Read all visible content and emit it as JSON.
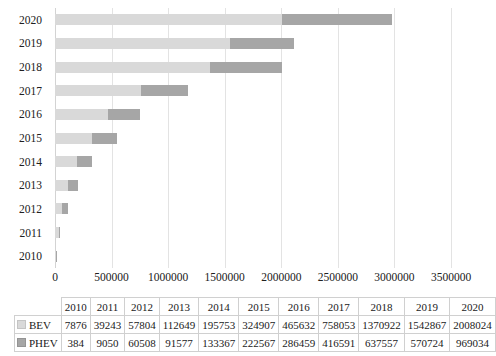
{
  "chart_data": {
    "type": "bar",
    "orientation": "horizontal",
    "stacked": true,
    "title": "",
    "xlabel": "",
    "ylabel": "",
    "categories": [
      "2010",
      "2011",
      "2012",
      "2013",
      "2014",
      "2015",
      "2016",
      "2017",
      "2018",
      "2019",
      "2020"
    ],
    "series": [
      {
        "name": "BEV",
        "color": "#d9d9d9",
        "values": [
          7876,
          39243,
          57804,
          112649,
          195753,
          324907,
          465632,
          758053,
          1370922,
          1542867,
          2008024
        ]
      },
      {
        "name": "PHEV",
        "color": "#a6a6a6",
        "values": [
          384,
          9050,
          60508,
          91577,
          133367,
          222567,
          286459,
          416591,
          637557,
          570724,
          969034
        ]
      }
    ],
    "xlim": [
      0,
      3500000
    ],
    "xticks": [
      0,
      500000,
      1000000,
      1500000,
      2000000,
      2500000,
      3000000,
      3500000
    ],
    "xtick_labels": [
      "0",
      "500000",
      "1000000",
      "1500000",
      "2000000",
      "2500000",
      "3000000",
      "3500000"
    ],
    "grid": true,
    "legend_position": "data-table-below"
  },
  "data_table": {
    "corner_label": "",
    "column_headers": [
      "2010",
      "2011",
      "2012",
      "2013",
      "2014",
      "2015",
      "2016",
      "2017",
      "2018",
      "2019",
      "2020"
    ],
    "rows": [
      {
        "label": "BEV",
        "swatch_color": "#d9d9d9",
        "cells": [
          "7876",
          "39243",
          "57804",
          "112649",
          "195753",
          "324907",
          "465632",
          "758053",
          "1370922",
          "1542867",
          "2008024"
        ]
      },
      {
        "label": "PHEV",
        "swatch_color": "#a6a6a6",
        "cells": [
          "384",
          "9050",
          "60508",
          "91577",
          "133367",
          "222567",
          "286459",
          "416591",
          "637557",
          "570724",
          "969034"
        ]
      }
    ]
  }
}
